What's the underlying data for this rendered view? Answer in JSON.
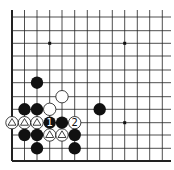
{
  "diagram": {
    "type": "go-board-fragment",
    "background": "#ffffff",
    "line_color": "#222222",
    "grid": {
      "columns_x": [
        12,
        24.5,
        37,
        49.7,
        62,
        74.7,
        87.3,
        99.7,
        112.3,
        124.7,
        137.3,
        149.7,
        162.3
      ],
      "rows_y": [
        17,
        30.7,
        43.3,
        56,
        70,
        82.7,
        96.7,
        109.3,
        122.7,
        135,
        148.3,
        161
      ],
      "open_top_y": 10,
      "open_right_x": 171,
      "edges": [
        "left",
        "bottom"
      ]
    },
    "star_points": [
      {
        "col": 3,
        "row": 2
      },
      {
        "col": 9,
        "row": 2
      },
      {
        "col": 9,
        "row": 8
      }
    ],
    "stones": [
      {
        "col": 2,
        "row": 5,
        "color": "black",
        "label": ""
      },
      {
        "col": 4,
        "row": 6,
        "color": "white",
        "label": ""
      },
      {
        "col": 1,
        "row": 7,
        "color": "black",
        "label": ""
      },
      {
        "col": 2,
        "row": 7,
        "color": "black",
        "label": ""
      },
      {
        "col": 3,
        "row": 7,
        "color": "white",
        "label": ""
      },
      {
        "col": 7,
        "row": 7,
        "color": "black",
        "label": ""
      },
      {
        "col": 0,
        "row": 8,
        "color": "white",
        "label": "triangle"
      },
      {
        "col": 1,
        "row": 8,
        "color": "white",
        "label": "triangle"
      },
      {
        "col": 2,
        "row": 8,
        "color": "white",
        "label": "triangle"
      },
      {
        "col": 3,
        "row": 8,
        "color": "black",
        "label": "1"
      },
      {
        "col": 4,
        "row": 8,
        "color": "black",
        "label": ""
      },
      {
        "col": 5,
        "row": 8,
        "color": "white",
        "label": "2"
      },
      {
        "col": 1,
        "row": 9,
        "color": "black",
        "label": ""
      },
      {
        "col": 2,
        "row": 9,
        "color": "black",
        "label": ""
      },
      {
        "col": 3,
        "row": 9,
        "color": "white",
        "label": "triangle"
      },
      {
        "col": 4,
        "row": 9,
        "color": "white",
        "label": "triangle"
      },
      {
        "col": 5,
        "row": 9,
        "color": "black",
        "label": ""
      },
      {
        "col": 2,
        "row": 10,
        "color": "black",
        "label": ""
      },
      {
        "col": 5,
        "row": 10,
        "color": "black",
        "label": ""
      }
    ]
  }
}
